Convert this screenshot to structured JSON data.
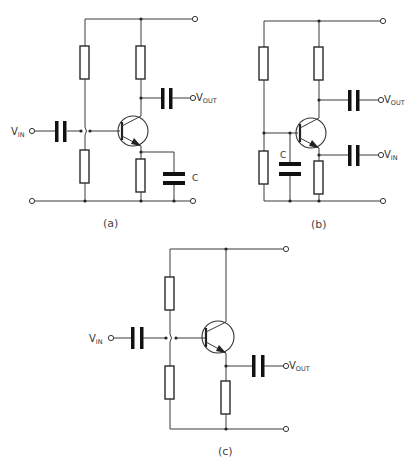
{
  "figure": {
    "circuits": [
      {
        "id": "a",
        "caption": "(a)",
        "input_label": {
          "main": "V",
          "sub": "IN"
        },
        "output_label": {
          "main": "V",
          "sub": "OUT"
        },
        "capacitor_label": "C",
        "configuration": "common-emitter"
      },
      {
        "id": "b",
        "caption": "(b)",
        "input_label": {
          "main": "V",
          "sub": "IN"
        },
        "output_label": {
          "main": "V",
          "sub": "OUT"
        },
        "capacitor_label": "C",
        "configuration": "common-base"
      },
      {
        "id": "c",
        "caption": "(c)",
        "input_label": {
          "main": "V",
          "sub": "IN"
        },
        "output_label": {
          "main": "V",
          "sub": "OUT"
        },
        "configuration": "common-collector"
      }
    ]
  }
}
